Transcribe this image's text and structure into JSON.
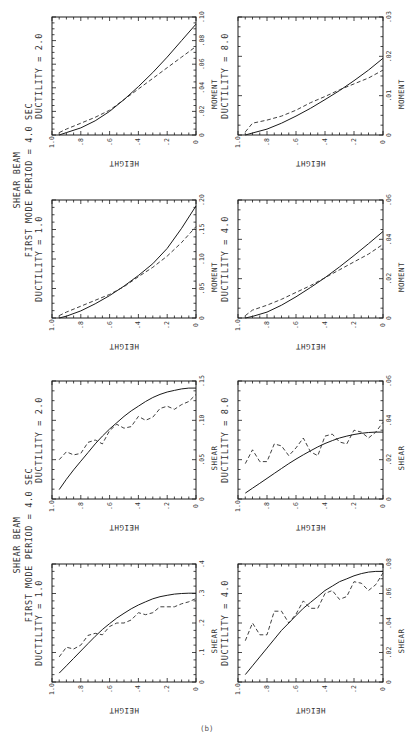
{
  "figure": {
    "group_titles": [
      {
        "line1": "SHEAR BEAM",
        "line2": "FIRST MODE PERIOD = 4.0 SEC"
      },
      {
        "line1": "SHEAR BEAM",
        "line2": "FIRST MODE PERIOD = 4.0 SEC"
      }
    ],
    "page_label": "(b)"
  },
  "chart_data": [
    {
      "type": "line",
      "id": "moment-d2",
      "title": "DUCTILITY = 2.0",
      "xlabel": "HEIGHT",
      "ylabel": "MOMENT",
      "xlim": [
        1.0,
        0
      ],
      "ylim": [
        0,
        0.1
      ],
      "xticks": [
        "1.0",
        ".8",
        ".6",
        ".4",
        ".2",
        "0"
      ],
      "yticks": [
        "0",
        ".02",
        ".04",
        ".06",
        ".08",
        ".10"
      ],
      "x": [
        0.95,
        0.9,
        0.8,
        0.7,
        0.6,
        0.5,
        0.4,
        0.3,
        0.2,
        0.1,
        0
      ],
      "series": [
        {
          "name": "solid",
          "style": "solid",
          "values": [
            0.0,
            0.002,
            0.006,
            0.012,
            0.02,
            0.03,
            0.041,
            0.053,
            0.066,
            0.08,
            0.094
          ]
        },
        {
          "name": "dashed",
          "style": "dashed",
          "values": [
            0.002,
            0.005,
            0.01,
            0.015,
            0.021,
            0.03,
            0.039,
            0.048,
            0.057,
            0.066,
            0.075
          ]
        }
      ]
    },
    {
      "type": "line",
      "id": "moment-d1",
      "title": "DUCTILITY = 1.0",
      "xlabel": "HEIGHT",
      "ylabel": "MOMENT",
      "xlim": [
        1.0,
        0
      ],
      "ylim": [
        0,
        0.2
      ],
      "xticks": [
        "1.0",
        ".8",
        ".6",
        ".4",
        ".2",
        "0"
      ],
      "yticks": [
        "0",
        ".05",
        ".10",
        ".15",
        ".20"
      ],
      "x": [
        0.95,
        0.9,
        0.8,
        0.7,
        0.6,
        0.5,
        0.4,
        0.3,
        0.2,
        0.1,
        0
      ],
      "series": [
        {
          "name": "solid",
          "style": "solid",
          "values": [
            0.0,
            0.003,
            0.012,
            0.024,
            0.038,
            0.054,
            0.072,
            0.092,
            0.118,
            0.152,
            0.19
          ]
        },
        {
          "name": "dashed",
          "style": "dashed",
          "values": [
            0.004,
            0.01,
            0.02,
            0.03,
            0.04,
            0.053,
            0.07,
            0.086,
            0.105,
            0.128,
            0.155
          ]
        }
      ]
    },
    {
      "type": "line",
      "id": "shear-d2",
      "title": "DUCTILITY = 2.0",
      "xlabel": "HEIGHT",
      "ylabel": "SHEAR",
      "xlim": [
        1.0,
        0
      ],
      "ylim": [
        0,
        0.15
      ],
      "xticks": [
        "1.0",
        ".8",
        ".6",
        ".4",
        ".2",
        "0"
      ],
      "yticks": [
        "0",
        ".05",
        ".10",
        ".15"
      ],
      "x": [
        0.95,
        0.9,
        0.85,
        0.8,
        0.75,
        0.7,
        0.65,
        0.6,
        0.55,
        0.5,
        0.45,
        0.4,
        0.35,
        0.3,
        0.25,
        0.2,
        0.15,
        0.1,
        0.05,
        0
      ],
      "series": [
        {
          "name": "solid",
          "style": "solid",
          "values": [
            0.012,
            0.025,
            0.037,
            0.048,
            0.059,
            0.07,
            0.08,
            0.089,
            0.097,
            0.105,
            0.112,
            0.118,
            0.124,
            0.129,
            0.133,
            0.136,
            0.138,
            0.14,
            0.141,
            0.141
          ]
        },
        {
          "name": "dashed",
          "style": "dashed",
          "values": [
            0.05,
            0.06,
            0.056,
            0.058,
            0.072,
            0.075,
            0.07,
            0.087,
            0.095,
            0.09,
            0.092,
            0.105,
            0.1,
            0.104,
            0.115,
            0.118,
            0.114,
            0.12,
            0.124,
            0.133
          ]
        }
      ]
    },
    {
      "type": "line",
      "id": "shear-d1",
      "title": "DUCTILITY = 1.0",
      "xlabel": "HEIGHT",
      "ylabel": "SHEAR",
      "xlim": [
        1.0,
        0
      ],
      "ylim": [
        0,
        0.4
      ],
      "xticks": [
        "1.0",
        ".8",
        ".6",
        ".4",
        ".2",
        "0"
      ],
      "yticks": [
        "0",
        ".1",
        ".2",
        ".3",
        ".4"
      ],
      "x": [
        0.95,
        0.9,
        0.85,
        0.8,
        0.75,
        0.7,
        0.65,
        0.6,
        0.55,
        0.5,
        0.45,
        0.4,
        0.35,
        0.3,
        0.25,
        0.2,
        0.15,
        0.1,
        0.05,
        0
      ],
      "series": [
        {
          "name": "solid",
          "style": "solid",
          "values": [
            0.03,
            0.055,
            0.08,
            0.105,
            0.13,
            0.155,
            0.178,
            0.198,
            0.217,
            0.233,
            0.248,
            0.261,
            0.272,
            0.282,
            0.289,
            0.294,
            0.298,
            0.3,
            0.301,
            0.301
          ]
        },
        {
          "name": "dashed",
          "style": "dashed",
          "values": [
            0.085,
            0.118,
            0.112,
            0.125,
            0.158,
            0.165,
            0.16,
            0.188,
            0.2,
            0.2,
            0.21,
            0.235,
            0.228,
            0.235,
            0.255,
            0.255,
            0.255,
            0.265,
            0.272,
            0.283
          ]
        }
      ]
    },
    {
      "type": "line",
      "id": "moment-d8",
      "title": "DUCTILITY = 8.0",
      "xlabel": "HEIGHT",
      "ylabel": "MOMENT",
      "xlim": [
        1.0,
        0
      ],
      "ylim": [
        0,
        0.03
      ],
      "xticks": [
        "1.0",
        ".8",
        ".6",
        ".4",
        ".2",
        "0"
      ],
      "yticks": [
        "0",
        ".01",
        ".02",
        ".03"
      ],
      "x": [
        0.95,
        0.9,
        0.8,
        0.7,
        0.6,
        0.5,
        0.4,
        0.3,
        0.2,
        0.1,
        0
      ],
      "series": [
        {
          "name": "solid",
          "style": "solid",
          "values": [
            0.0,
            0.0005,
            0.0015,
            0.003,
            0.0048,
            0.0068,
            0.009,
            0.0113,
            0.0138,
            0.0165,
            0.0195
          ]
        },
        {
          "name": "dashed",
          "style": "dashed",
          "values": [
            0.0008,
            0.003,
            0.0038,
            0.0048,
            0.0063,
            0.0082,
            0.0098,
            0.0115,
            0.013,
            0.0145,
            0.0165
          ]
        }
      ]
    },
    {
      "type": "line",
      "id": "moment-d4",
      "title": "DUCTILITY = 4.0",
      "xlabel": "HEIGHT",
      "ylabel": "MOMENT",
      "xlim": [
        1.0,
        0
      ],
      "ylim": [
        0,
        0.06
      ],
      "xticks": [
        "1.0",
        ".8",
        ".6",
        ".4",
        ".2",
        "0"
      ],
      "yticks": [
        "0",
        ".02",
        ".04",
        ".06"
      ],
      "x": [
        0.95,
        0.9,
        0.8,
        0.7,
        0.6,
        0.5,
        0.4,
        0.3,
        0.2,
        0.1,
        0
      ],
      "series": [
        {
          "name": "solid",
          "style": "solid",
          "values": [
            0.0,
            0.0008,
            0.003,
            0.0065,
            0.0108,
            0.0155,
            0.0205,
            0.026,
            0.0318,
            0.0378,
            0.044
          ]
        },
        {
          "name": "dashed",
          "style": "dashed",
          "values": [
            0.0012,
            0.004,
            0.0065,
            0.0095,
            0.013,
            0.0165,
            0.0205,
            0.0245,
            0.0285,
            0.0325,
            0.0375
          ]
        }
      ]
    },
    {
      "type": "line",
      "id": "shear-d8",
      "title": "DUCTILITY = 8.0",
      "xlabel": "HEIGHT",
      "ylabel": "SHEAR",
      "xlim": [
        1.0,
        0
      ],
      "ylim": [
        0,
        0.06
      ],
      "xticks": [
        "1.0",
        ".8",
        ".6",
        ".4",
        ".2",
        "0"
      ],
      "yticks": [
        "0",
        ".02",
        ".04",
        ".06"
      ],
      "x": [
        0.95,
        0.9,
        0.85,
        0.8,
        0.75,
        0.7,
        0.65,
        0.6,
        0.55,
        0.5,
        0.45,
        0.4,
        0.35,
        0.3,
        0.25,
        0.2,
        0.15,
        0.1,
        0.05,
        0
      ],
      "series": [
        {
          "name": "solid",
          "style": "solid",
          "values": [
            0.003,
            0.0055,
            0.008,
            0.0105,
            0.013,
            0.0155,
            0.018,
            0.0203,
            0.0225,
            0.0245,
            0.0265,
            0.0282,
            0.0297,
            0.031,
            0.032,
            0.0328,
            0.0334,
            0.0338,
            0.034,
            0.034
          ]
        },
        {
          "name": "dashed",
          "style": "dashed",
          "values": [
            0.018,
            0.025,
            0.019,
            0.019,
            0.028,
            0.027,
            0.022,
            0.026,
            0.031,
            0.024,
            0.022,
            0.032,
            0.033,
            0.029,
            0.028,
            0.035,
            0.034,
            0.031,
            0.034,
            0.039
          ]
        }
      ]
    },
    {
      "type": "line",
      "id": "shear-d4",
      "title": "DUCTILITY = 4.0",
      "xlabel": "HEIGHT",
      "ylabel": "SHEAR",
      "xlim": [
        1.0,
        0
      ],
      "ylim": [
        0,
        0.08
      ],
      "xticks": [
        "1.0",
        ".8",
        ".6",
        ".4",
        ".2",
        "0"
      ],
      "yticks": [
        "0",
        ".02",
        ".04",
        ".06",
        ".08"
      ],
      "x": [
        0.95,
        0.9,
        0.85,
        0.8,
        0.75,
        0.7,
        0.65,
        0.6,
        0.55,
        0.5,
        0.45,
        0.4,
        0.35,
        0.3,
        0.25,
        0.2,
        0.15,
        0.1,
        0.05,
        0
      ],
      "series": [
        {
          "name": "solid",
          "style": "solid",
          "values": [
            0.005,
            0.011,
            0.017,
            0.023,
            0.029,
            0.035,
            0.04,
            0.045,
            0.05,
            0.054,
            0.058,
            0.062,
            0.065,
            0.068,
            0.07,
            0.072,
            0.0735,
            0.0745,
            0.075,
            0.075
          ]
        },
        {
          "name": "dashed",
          "style": "dashed",
          "values": [
            0.028,
            0.04,
            0.032,
            0.032,
            0.048,
            0.048,
            0.04,
            0.046,
            0.055,
            0.05,
            0.05,
            0.06,
            0.062,
            0.056,
            0.058,
            0.068,
            0.067,
            0.062,
            0.066,
            0.074
          ]
        }
      ]
    }
  ]
}
